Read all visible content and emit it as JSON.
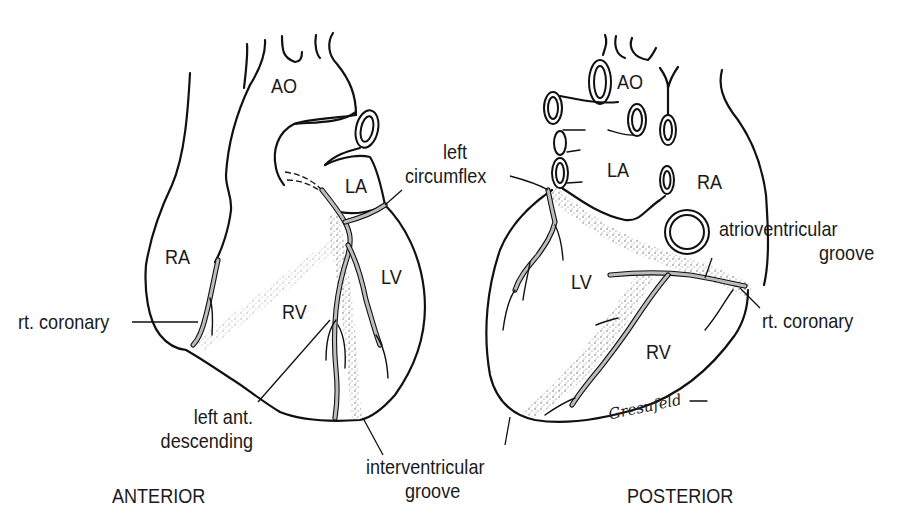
{
  "figure": {
    "views": [
      {
        "id": "anterior",
        "caption": "ANTERIOR"
      },
      {
        "id": "posterior",
        "caption": "POSTERIOR"
      }
    ],
    "anterior": {
      "labels": {
        "ao": "AO",
        "la": "LA",
        "ra": "RA",
        "rv": "RV",
        "lv": "LV",
        "rt_coronary": "rt. coronary",
        "left_ant_descending_line1": "left ant.",
        "left_ant_descending_line2": "descending"
      }
    },
    "shared": {
      "left_circumflex_line1": "left",
      "left_circumflex_line2": "circumflex",
      "interventricular_groove_line1": "interventricular",
      "interventricular_groove_line2": "groove"
    },
    "posterior": {
      "labels": {
        "ao": "AO",
        "la": "LA",
        "ra": "RA",
        "lv": "LV",
        "rv": "RV",
        "atrioventricular_groove_line1": "atrioventricular",
        "atrioventricular_groove_line2": "groove",
        "rt_coronary": "rt. coronary"
      }
    },
    "signature": "Gresufeld",
    "colors": {
      "line": "#111111",
      "vessel_fill": "#b9b9b9",
      "background": "#ffffff"
    }
  }
}
